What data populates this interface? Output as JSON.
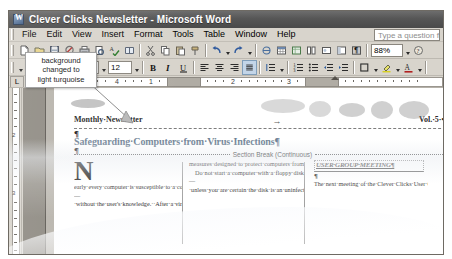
{
  "window": {
    "title": "Clever Clicks Newsletter - Microsoft Word",
    "icon": "word-document-icon"
  },
  "menubar": {
    "items": [
      {
        "label": "File"
      },
      {
        "label": "Edit"
      },
      {
        "label": "View"
      },
      {
        "label": "Insert"
      },
      {
        "label": "Format"
      },
      {
        "label": "Tools"
      },
      {
        "label": "Table"
      },
      {
        "label": "Window"
      },
      {
        "label": "Help"
      }
    ],
    "ask_a_question": "Type a question for help"
  },
  "standard_toolbar": {
    "buttons": [
      "new-document-icon",
      "open-icon",
      "save-icon",
      "permission-icon",
      "print-icon",
      "print-preview-icon",
      "spelling-check-icon",
      "research-icon",
      "cut-icon",
      "copy-icon",
      "paste-icon",
      "format-painter-icon",
      "undo-icon",
      "redo-icon",
      "insert-hyperlink-icon",
      "insert-table-icon",
      "insert-excel-table-icon",
      "columns-icon",
      "drawing-icon",
      "document-map-icon",
      "show-formatting-marks-icon",
      "reading-layout-icon"
    ],
    "zoom_value": "88%"
  },
  "formatting_toolbar": {
    "style_label": "",
    "font_name": "Times New Roman",
    "font_size": "12",
    "buttons": [
      "bold-icon",
      "italic-icon",
      "underline-icon",
      "align-left-icon",
      "align-center-icon",
      "align-right-icon",
      "justify-icon",
      "line-spacing-icon",
      "numbered-list-icon",
      "bulleted-list-icon",
      "decrease-indent-icon",
      "increase-indent-icon",
      "outside-border-icon",
      "highlight-icon",
      "font-color-icon"
    ],
    "active_button": "justify-icon"
  },
  "ruler": {
    "horizontal_numbers": [
      "1",
      "2",
      "3",
      "4"
    ],
    "vertical_numbers": [
      "2",
      "3"
    ],
    "corner_label": "L"
  },
  "callout": {
    "lines": [
      "background",
      "changed to",
      "light turquoise"
    ],
    "full_text": "background changed to light turquoise"
  },
  "document": {
    "header_left": "Monthly·Newsletter",
    "header_right": "Vol.·5·•·Issue·9",
    "header_tab_mark": "→",
    "headline": "Safeguarding·Computers·from·Virus·Infections¶",
    "pilcrow": "¶",
    "section_break_label": "Section Break (Continuous)",
    "columns": [
      {
        "dropcap": "N",
        "paragraphs": [
          "early·every·computer·is·susceptible·to·a·computer·virus.·This·potentially·harmful·program·can·infect·a·computer·and·negatively·affect·the·way·a·computer·works·—·without·the·user's·knowledge.··After·a·virus·infects·a·computer,·it·"
        ]
      },
      {
        "dropcap": "",
        "paragraphs": [
          "measures·designed·to·protect·computers·from·viruses.¶",
          "Do·not·start·a·computer·with·a·floppy·disk·in·drive·A·—·unless·you·are·certain·the·disk·is·an·uninfected·boot·disk.··All·floppy·disks·can·have·a·boot·sector.··During·the·startup·process,·the·"
        ]
      },
      {
        "dropcap": "",
        "heading": "USER·GROUP·MEETING¶",
        "pilcrow": "¶",
        "paragraphs": [
          "The·next·meeting·of·the·Clever·Clicks·User·Group·(CCUG)·will·be·held·on·Saturday,·October·8,·at·the·Remington·Valley·recreation·center·(440·Center·Street)·from·11:00·a.m.·to·3:00·p.m."
        ]
      }
    ]
  },
  "colors": {
    "title_bar": "#565656",
    "toolbar_bg": "#d8d4cc",
    "headline_color": "#6d7f93",
    "page_bg": "#ffffff",
    "workspace_bg": "#8f8b83"
  }
}
